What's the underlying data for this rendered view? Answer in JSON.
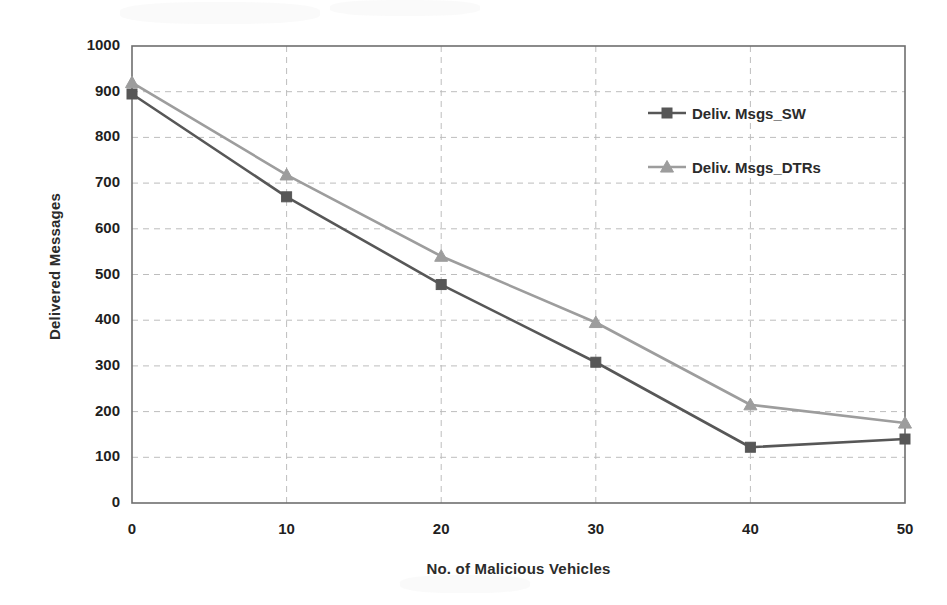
{
  "chart_data": {
    "type": "line",
    "title": "",
    "xlabel": "No. of Malicious Vehicles",
    "ylabel": "Delivered Messages",
    "x": [
      0,
      10,
      20,
      30,
      40,
      50
    ],
    "xticklabels": [
      "0",
      "10",
      "20",
      "30",
      "40",
      "50"
    ],
    "yticklabels": [
      "0",
      "100",
      "200",
      "300",
      "400",
      "500",
      "600",
      "700",
      "800",
      "900",
      "1000"
    ],
    "yticks": [
      0,
      100,
      200,
      300,
      400,
      500,
      600,
      700,
      800,
      900,
      1000
    ],
    "xlim": [
      0,
      50
    ],
    "ylim": [
      0,
      1000
    ],
    "grid": "horizontal-and-vertical-dashed",
    "legend_position": "inside-upper-right",
    "series": [
      {
        "name": "Deliv. Msgs_SW",
        "marker": "square",
        "color": "#575757",
        "values": [
          895,
          670,
          478,
          308,
          122,
          140
        ]
      },
      {
        "name": "Deliv. Msgs_DTRs",
        "marker": "triangle",
        "color": "#9d9d9d",
        "values": [
          920,
          718,
          540,
          395,
          215,
          175
        ]
      }
    ]
  },
  "legend": {
    "entries": [
      {
        "label": "Deliv. Msgs_SW"
      },
      {
        "label": "Deliv. Msgs_DTRs"
      }
    ]
  },
  "colors": {
    "series_sw": "#575757",
    "series_dtrs": "#9d9d9d",
    "axis": "#6e6e6e",
    "grid": "#bdbdbd",
    "text": "#1f1f1f"
  }
}
